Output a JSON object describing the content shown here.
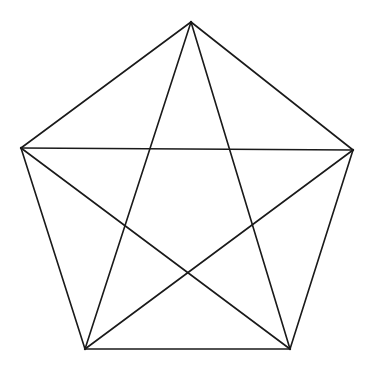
{
  "diagram": {
    "type": "pentagon-with-diagonals",
    "stroke_color": "#1a1a1a",
    "background_color": "#ffffff",
    "stroke_width": 1.6,
    "vertices": [
      {
        "id": "top",
        "x": 191,
        "y": 22
      },
      {
        "id": "right",
        "x": 353,
        "y": 150
      },
      {
        "id": "bottom-right",
        "x": 290,
        "y": 349
      },
      {
        "id": "bottom-left",
        "x": 85,
        "y": 349
      },
      {
        "id": "left",
        "x": 21,
        "y": 148
      }
    ],
    "edges": [
      {
        "kind": "side",
        "from": 0,
        "to": 1
      },
      {
        "kind": "side",
        "from": 1,
        "to": 2
      },
      {
        "kind": "side",
        "from": 2,
        "to": 3
      },
      {
        "kind": "side",
        "from": 3,
        "to": 4
      },
      {
        "kind": "side",
        "from": 4,
        "to": 0
      },
      {
        "kind": "diagonal",
        "from": 0,
        "to": 2
      },
      {
        "kind": "diagonal",
        "from": 0,
        "to": 3
      },
      {
        "kind": "diagonal",
        "from": 1,
        "to": 3
      },
      {
        "kind": "diagonal",
        "from": 1,
        "to": 4
      },
      {
        "kind": "diagonal",
        "from": 2,
        "to": 4
      }
    ]
  }
}
